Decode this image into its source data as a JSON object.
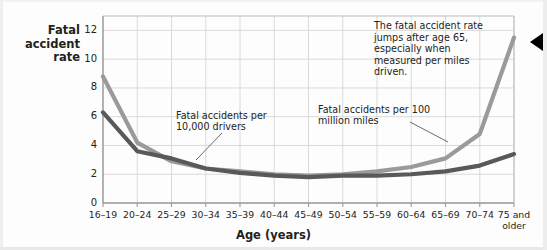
{
  "chart_data": {
    "type": "line",
    "title": "",
    "xlabel": "Age (years)",
    "ylabel": "Fatal accident rate",
    "ylabel_lines": [
      "Fatal",
      "accident",
      "rate"
    ],
    "categories": [
      "16–19",
      "20–24",
      "25–29",
      "30–34",
      "35–39",
      "40–44",
      "45–49",
      "50–54",
      "55–59",
      "60–64",
      "65–69",
      "70–74",
      "75 and\nolder"
    ],
    "ylim": [
      0,
      13
    ],
    "yticks": [
      0,
      2,
      4,
      6,
      8,
      10,
      12
    ],
    "grid": true,
    "legend_position": "inline-annotations",
    "series": [
      {
        "name": "Fatal accidents per 100 million miles",
        "color": "#9a9a9a",
        "values": [
          8.8,
          4.2,
          2.9,
          2.4,
          2.2,
          2.0,
          1.9,
          2.0,
          2.2,
          2.5,
          3.1,
          4.8,
          11.5
        ]
      },
      {
        "name": "Fatal accidents per 10,000 drivers",
        "color": "#58595b",
        "values": [
          6.3,
          3.6,
          3.1,
          2.4,
          2.1,
          1.9,
          1.8,
          1.9,
          1.9,
          2.0,
          2.2,
          2.6,
          3.4
        ]
      }
    ],
    "annotations": [
      {
        "id": "callout-age65",
        "text": "The fatal accident rate jumps after age 65, especially when measured per miles driven."
      },
      {
        "id": "series-label-drivers",
        "text": "Fatal accidents per 10,000 drivers"
      },
      {
        "id": "series-label-miles",
        "text": "Fatal accidents per 100 million miles"
      }
    ]
  },
  "axis": {
    "y_tick_labels": [
      "12",
      "10",
      "8",
      "6",
      "4",
      "2",
      "0"
    ],
    "x_label": "Age (years)"
  },
  "marker": {
    "name": "left-triangle-marker"
  }
}
